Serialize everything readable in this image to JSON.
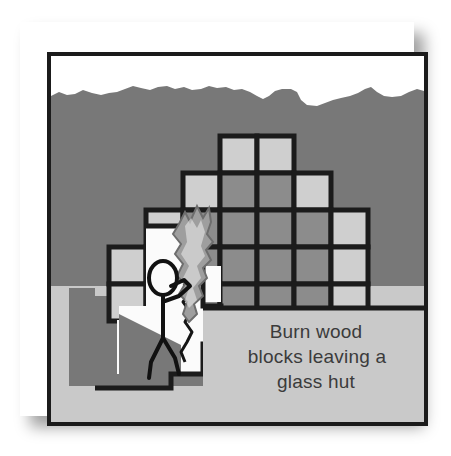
{
  "illustration": {
    "title": "Burn wood blocks leaving a glass hut",
    "caption_lines": [
      "Burn wood",
      "blocks leaving a",
      "glass hut"
    ],
    "colors": {
      "paper": "#ffffff",
      "frame_border": "#1b1b1b",
      "sky": "#ffffff",
      "dirt": "#787878",
      "stone_light": "#c9c9c9",
      "block_outline": "#1b1b1b",
      "block_dark": "#8c8c8c",
      "block_light": "#cfcfcf",
      "cave_air": "#fbfbfb",
      "figure_stroke": "#111111",
      "caption_text": "#3b3b3b",
      "flame": "#a8a8a8"
    },
    "scene": {
      "sky_label": "sky",
      "ground_label": "dirt ground",
      "underground_label": "underground stone layer",
      "cave_label": "hollow cave interior",
      "character_label": "stick figure person",
      "fire_label": "burning flame on wood block"
    },
    "grid": {
      "columns": 7,
      "rows": 5,
      "cell_size": 37,
      "origin_x": 58,
      "origin_y": 80,
      "legend": {
        "dark": "wood block (unburned)",
        "light": "glass block"
      },
      "cells": [
        {
          "col": 3,
          "row": 0,
          "tone": "light"
        },
        {
          "col": 4,
          "row": 0,
          "tone": "light"
        },
        {
          "col": 2,
          "row": 1,
          "tone": "light"
        },
        {
          "col": 3,
          "row": 1,
          "tone": "dark"
        },
        {
          "col": 4,
          "row": 1,
          "tone": "dark"
        },
        {
          "col": 5,
          "row": 1,
          "tone": "light"
        },
        {
          "col": 1,
          "row": 2,
          "tone": "light"
        },
        {
          "col": 2,
          "row": 2,
          "tone": "dark"
        },
        {
          "col": 3,
          "row": 2,
          "tone": "dark"
        },
        {
          "col": 4,
          "row": 2,
          "tone": "dark"
        },
        {
          "col": 5,
          "row": 2,
          "tone": "dark"
        },
        {
          "col": 6,
          "row": 2,
          "tone": "light"
        },
        {
          "col": 0,
          "row": 3,
          "tone": "light"
        },
        {
          "col": 1,
          "row": 3,
          "tone": "light"
        },
        {
          "col": 2,
          "row": 3,
          "tone": "dark"
        },
        {
          "col": 3,
          "row": 3,
          "tone": "dark"
        },
        {
          "col": 4,
          "row": 3,
          "tone": "dark"
        },
        {
          "col": 5,
          "row": 3,
          "tone": "dark"
        },
        {
          "col": 6,
          "row": 3,
          "tone": "light"
        },
        {
          "col": 0,
          "row": 4,
          "tone": "light"
        },
        {
          "col": 1,
          "row": 4,
          "tone": "light"
        },
        {
          "col": 2,
          "row": 4,
          "tone": "dark"
        },
        {
          "col": 3,
          "row": 4,
          "tone": "dark"
        },
        {
          "col": 4,
          "row": 4,
          "tone": "dark"
        },
        {
          "col": 5,
          "row": 4,
          "tone": "dark"
        },
        {
          "col": 6,
          "row": 4,
          "tone": "light"
        }
      ]
    }
  }
}
